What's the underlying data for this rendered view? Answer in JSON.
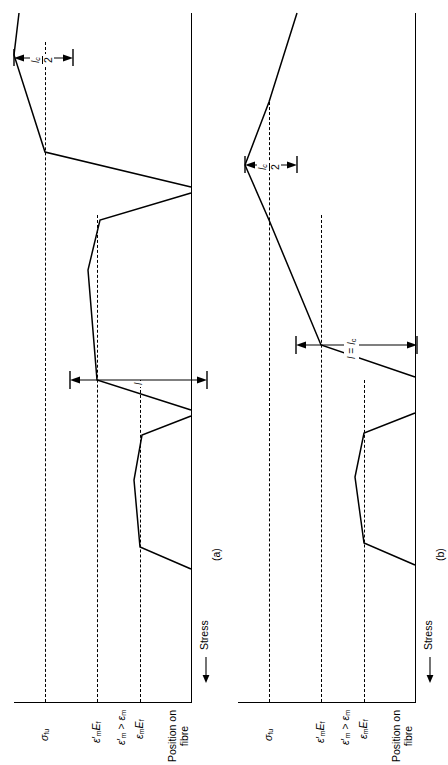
{
  "figure": {
    "type": "fibre-stress-distribution-diagram",
    "orientation": "rotated-90-ccw",
    "panels": [
      {
        "tag": "(a)",
        "id": "panel-a",
        "axis_y_label": "Stress",
        "axis_y_arrow": "left-arrow",
        "axis_x_label_line1": "Position on",
        "axis_x_label_line2": "fibre",
        "levels": [
          {
            "name": "sigma-fu",
            "label_html": "sigma_fu",
            "text": "σƒu"
          },
          {
            "name": "eps-m-prime-Ef",
            "text": "ε'mEf"
          },
          {
            "name": "eps-m-Ef",
            "text": "εmEf"
          }
        ],
        "condition_note": "ε'm > εm",
        "dimensions": [
          {
            "name": "lc-over-2",
            "numerator": "lᴄ",
            "denominator": "2"
          },
          {
            "name": "l",
            "label": "l"
          }
        ],
        "curves": [
          "long-fibre-reaching-sigma-fu",
          "intermediate-fibre-trapezoid",
          "short-fibre-trapezoid"
        ]
      },
      {
        "tag": "(b)",
        "id": "panel-b",
        "axis_y_label": "Stress",
        "axis_y_arrow": "left-arrow",
        "axis_x_label_line1": "Position on",
        "axis_x_label_line2": "fibre",
        "levels": [
          {
            "name": "sigma-fu",
            "text": "σƒu"
          },
          {
            "name": "eps-m-prime-Ef",
            "text": "ε'mEf"
          },
          {
            "name": "eps-m-Ef",
            "text": "εmEf"
          }
        ],
        "condition_note": "ε'm > εm",
        "dimensions": [
          {
            "name": "lc-over-2",
            "numerator": "lᴄ",
            "denominator": "2"
          },
          {
            "name": "l-equals-lc",
            "label": "l = lᴄ"
          }
        ],
        "curves": [
          "critical-fibre-triangle",
          "short-fibre-trapezoid"
        ]
      }
    ],
    "labels": {
      "sigma_fu": "σ",
      "sigma_fu_sub": "fu",
      "eps_prime": "ε",
      "eps_prime_mark": "′",
      "eps_sub_m": "m",
      "E_f": "E",
      "E_f_sub": "f",
      "condition": "ε′m > εm",
      "stress": "Stress",
      "position_l1": "Position on",
      "position_l2": "fibre",
      "lc_num": "l",
      "lc_num_sub": "c",
      "lc_den": "2",
      "l_plain": "l",
      "l_equals_lc": "l = l",
      "l_equals_lc_sub": "c",
      "tag_a": "(a)",
      "tag_b": "(b)"
    },
    "colors": {
      "ink": "#000000",
      "background": "#ffffff"
    }
  }
}
